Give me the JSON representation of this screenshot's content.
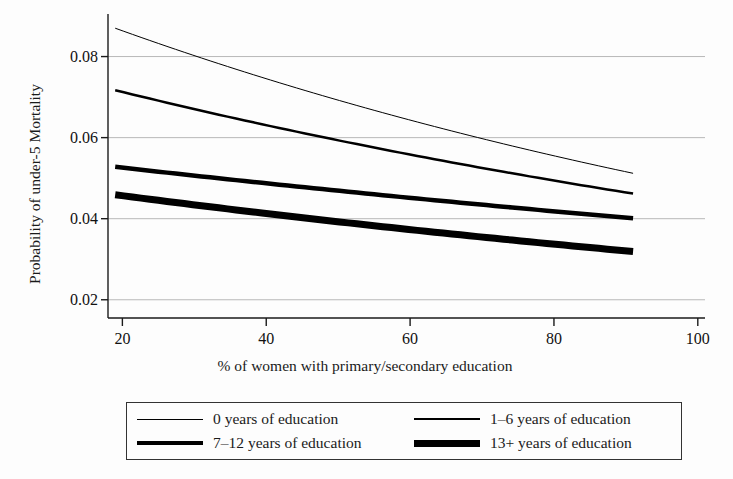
{
  "figure": {
    "background_color": "#fdfdfd",
    "line_color": "#000000",
    "grid_color": "#b8b8b8",
    "axis_color": "#1a1a1a"
  },
  "chart_data": {
    "type": "line",
    "title": "",
    "xlabel": "% of women with primary/secondary education",
    "ylabel": "Probability of under-5 Mortality",
    "xlim": [
      18,
      101
    ],
    "ylim": [
      0.0155,
      0.0905
    ],
    "xticks": [
      20,
      40,
      60,
      80,
      100
    ],
    "xtick_labels": [
      "20",
      "40",
      "60",
      "80",
      "100"
    ],
    "yticks": [
      0.02,
      0.04,
      0.06,
      0.08
    ],
    "ytick_labels": [
      "0.02",
      "0.04",
      "0.06",
      "0.08"
    ],
    "grid": "horizontal",
    "legend_position": "below-axes",
    "x": [
      19,
      91
    ],
    "series": [
      {
        "name": "0 years of education",
        "linewidth": 1,
        "values": [
          0.087,
          0.0512
        ]
      },
      {
        "name": "1-6 years of education",
        "linewidth": 2.5,
        "values": [
          0.0717,
          0.0462
        ]
      },
      {
        "name": "7-12 years of education",
        "linewidth": 4.5,
        "values": [
          0.0528,
          0.0401
        ]
      },
      {
        "name": "13+ years of education",
        "linewidth": 7,
        "values": [
          0.0459,
          0.0319
        ]
      }
    ]
  },
  "legend": {
    "items": [
      {
        "label": "0 years of education",
        "weight": "lw1"
      },
      {
        "label": "1–6 years of education",
        "weight": "lw2"
      },
      {
        "label": "7–12 years of education",
        "weight": "lw3"
      },
      {
        "label": "13+ years of education",
        "weight": "lw4"
      }
    ]
  }
}
